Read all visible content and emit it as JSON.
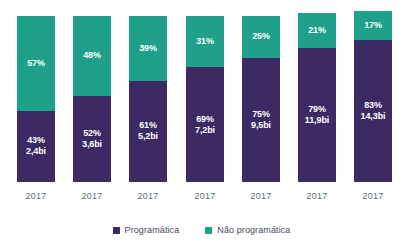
{
  "chart_data": {
    "type": "bar",
    "stacked": true,
    "title": "",
    "xlabel": "",
    "ylabel": "",
    "ylim": [
      0,
      100
    ],
    "grid": false,
    "legend_position": "bottom",
    "categories": [
      "2017",
      "2017",
      "2017",
      "2017",
      "2017",
      "2017",
      "2017"
    ],
    "series": [
      {
        "name": "Programática",
        "color": "#3b2a63",
        "values": [
          43,
          52,
          61,
          69,
          75,
          79,
          83
        ],
        "value_labels": [
          "43%",
          "52%",
          "61%",
          "69%",
          "75%",
          "79%",
          "83%"
        ],
        "amount_labels": [
          "2,4bi",
          "3,6bi",
          "5,2bi",
          "7,2bi",
          "9,5bi",
          "11,9bi",
          "14,3bi"
        ]
      },
      {
        "name": "Não programática",
        "color": "#1fa08a",
        "values": [
          57,
          48,
          39,
          31,
          25,
          21,
          17
        ],
        "value_labels": [
          "57%",
          "48%",
          "39%",
          "31%",
          "25%",
          "21%",
          "17%"
        ],
        "amount_labels": [
          "",
          "",
          "",
          "",
          "",
          "",
          ""
        ]
      }
    ],
    "bar_total_heights_px": [
      166,
      166,
      166,
      166,
      166,
      169,
      171
    ],
    "annotations": []
  },
  "legend": {
    "items": [
      {
        "label": "Programática",
        "color": "#3b2a63",
        "swatch": "square-swatch-dark"
      },
      {
        "label": "Não programática",
        "color": "#1fa08a",
        "swatch": "square-swatch-teal"
      }
    ]
  },
  "axis": {
    "x_tick_labels": [
      "2017",
      "2017",
      "2017",
      "2017",
      "2017",
      "2017",
      "2017"
    ]
  },
  "title_remnant": "",
  "colors": {
    "programatica": "#3b2a63",
    "nao_programatica": "#1fa08a",
    "background": "#ffffff",
    "axis_text": "#5c6b73",
    "legend_text": "#3f4a5a"
  }
}
